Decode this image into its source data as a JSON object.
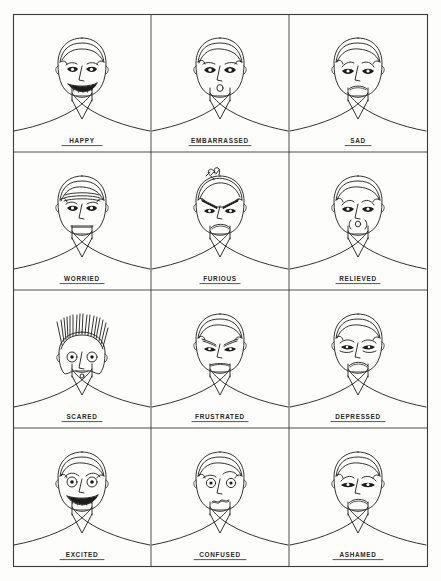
{
  "page": {
    "background_color": "#fdfdfc",
    "ink_color": "#1c1c1c",
    "frame_color": "#3a3a3a",
    "grid": {
      "columns": 3,
      "rows": 4
    }
  },
  "cells": [
    {
      "id": "happy",
      "label": "HAPPY",
      "row": 1,
      "col": 1
    },
    {
      "id": "embarrassed",
      "label": "EMBARRASSED",
      "row": 1,
      "col": 2
    },
    {
      "id": "sad",
      "label": "SAD",
      "row": 1,
      "col": 3
    },
    {
      "id": "worried",
      "label": "WORRIED",
      "row": 2,
      "col": 1
    },
    {
      "id": "furious",
      "label": "FURIOUS",
      "row": 2,
      "col": 2
    },
    {
      "id": "relieved",
      "label": "RELIEVED",
      "row": 2,
      "col": 3
    },
    {
      "id": "scared",
      "label": "SCARED",
      "row": 3,
      "col": 1
    },
    {
      "id": "frustrated",
      "label": "FRUSTRATED",
      "row": 3,
      "col": 2
    },
    {
      "id": "depressed",
      "label": "DEPRESSED",
      "row": 3,
      "col": 3
    },
    {
      "id": "excited",
      "label": "EXCITED",
      "row": 4,
      "col": 1
    },
    {
      "id": "confused",
      "label": "CONFUSED",
      "row": 4,
      "col": 2
    },
    {
      "id": "ashamed",
      "label": "ASHAMED",
      "row": 4,
      "col": 3
    }
  ]
}
